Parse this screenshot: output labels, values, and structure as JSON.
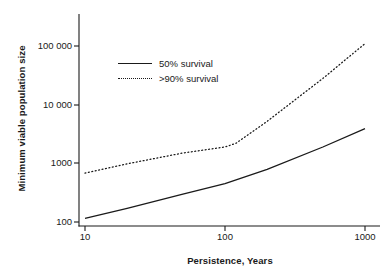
{
  "chart_data": {
    "type": "line",
    "title": "",
    "xlabel": "Persistence, Years",
    "ylabel": "Minimum viable population size",
    "xscale": "log",
    "yscale": "log",
    "xlim": [
      10,
      1000
    ],
    "ylim": [
      100,
      250000
    ],
    "grid": false,
    "legend_position": "upper-left-inside",
    "xticks": [
      "10",
      "100",
      "1000"
    ],
    "xtick_values": [
      10,
      100,
      1000
    ],
    "yticks": [
      "100",
      "1000",
      "10 000",
      "100 000"
    ],
    "ytick_values": [
      100,
      1000,
      10000,
      100000
    ],
    "series": [
      {
        "name": "50% survival",
        "style": "solid",
        "color": "#1a1a1a",
        "x": [
          10,
          20,
          50,
          100,
          200,
          500,
          1000
        ],
        "values": [
          115,
          170,
          300,
          450,
          790,
          1900,
          3900
        ]
      },
      {
        "name": ">90% survival",
        "style": "dotted",
        "color": "#1a1a1a",
        "x": [
          10,
          20,
          50,
          100,
          120,
          200,
          500,
          1000
        ],
        "values": [
          680,
          980,
          1500,
          1900,
          2200,
          5200,
          28000,
          110000
        ]
      }
    ]
  },
  "legend": {
    "entries": [
      {
        "label": "50% survival",
        "style": "solid"
      },
      {
        "label": ">90% survival",
        "style": "dotted"
      }
    ]
  },
  "axes": {
    "x_title": "Persistence, Years",
    "y_title": "Minimum viable population size",
    "x_tick_labels": [
      "10",
      "100",
      "1000"
    ],
    "y_tick_labels": [
      "100",
      "1000",
      "10 000",
      "100 000"
    ]
  }
}
